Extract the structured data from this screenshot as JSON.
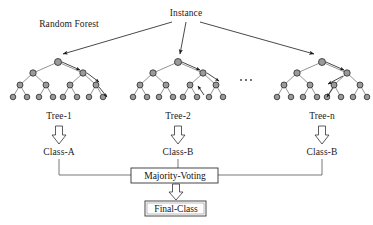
{
  "diagram": {
    "title_label": "Instance",
    "forest_label": "Random Forest",
    "ellipsis": "...",
    "colors": {
      "node_fill": "#9a9a9a",
      "node_stroke": "#2b2b2b",
      "edge": "#555555",
      "arrow": "#1a1a1a",
      "box_stroke": "#333333",
      "text": "#1a1a1a",
      "background": "#ffffff"
    },
    "trees": [
      {
        "name": "Tree-1",
        "label": "Tree-1",
        "prediction": "Class-A",
        "root_x": 58
      },
      {
        "name": "Tree-2",
        "label": "Tree-2",
        "prediction": "Class-B",
        "root_x": 178
      },
      {
        "name": "Tree-n",
        "label": "Tree-n",
        "prediction": "Class-B",
        "root_x": 322
      }
    ],
    "aggregation_box": "Majority-Voting",
    "output_box": "Final-Class",
    "node_counts": {
      "level_1": 1,
      "level_2": 2,
      "level_3": 4,
      "level_4": 8,
      "total_per_tree": 15
    }
  }
}
